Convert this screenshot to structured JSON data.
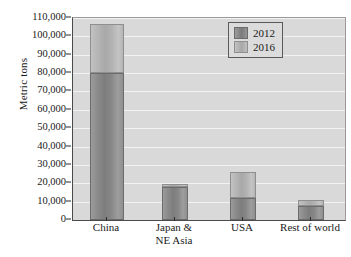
{
  "chart_data": {
    "type": "bar",
    "stacked": true,
    "title": "",
    "xlabel": "",
    "ylabel": "Metric tons",
    "categories": [
      "China",
      "Japan &\nNE Asia",
      "USA",
      "Rest of world"
    ],
    "series": [
      {
        "name": "2012",
        "values": [
          80000,
          18000,
          12000,
          7500
        ],
        "color": "#8a8a8a"
      },
      {
        "name": "2016",
        "values": [
          107000,
          19500,
          26000,
          11000
        ],
        "color": "#b3b3b3"
      }
    ],
    "ylim": [
      0,
      110000
    ],
    "yticks": [
      0,
      10000,
      20000,
      30000,
      40000,
      50000,
      60000,
      70000,
      80000,
      90000,
      100000,
      110000
    ],
    "ytick_labels": [
      "0",
      "10,000",
      "20,000",
      "30,000",
      "40,000",
      "50,000",
      "60,000",
      "70,000",
      "80,000",
      "90,000",
      "100,000",
      "110,000"
    ],
    "grid": true,
    "grid_color": "#f2f2f2",
    "plot_background": "#d9d9d9",
    "legend_position": "top-right",
    "legend_entries": [
      "2012",
      "2016"
    ]
  },
  "legend": {
    "entries": [
      {
        "label": "2012",
        "swatch": "legend-swatch-2012"
      },
      {
        "label": "2016",
        "swatch": "legend-swatch-2016"
      }
    ]
  },
  "axes": {
    "y_title": "Metric tons"
  }
}
